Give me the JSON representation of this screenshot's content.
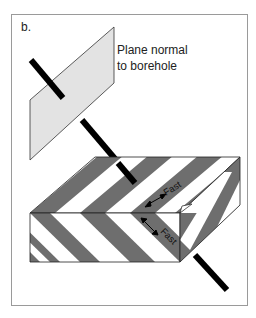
{
  "figure": {
    "panel_label": "b.",
    "caption_lines": [
      "Plane normal",
      "to borehole"
    ],
    "annotations": [
      {
        "label": "Fast",
        "position": "top-face"
      },
      {
        "label": "Fast",
        "position": "front-face"
      }
    ]
  },
  "colors": {
    "plane_fill": "#e3e3e3",
    "stripe_dark": "#6e6e6e",
    "stripe_light": "#ffffff",
    "borehole": "#000000",
    "frame": "#9a9a9a"
  }
}
